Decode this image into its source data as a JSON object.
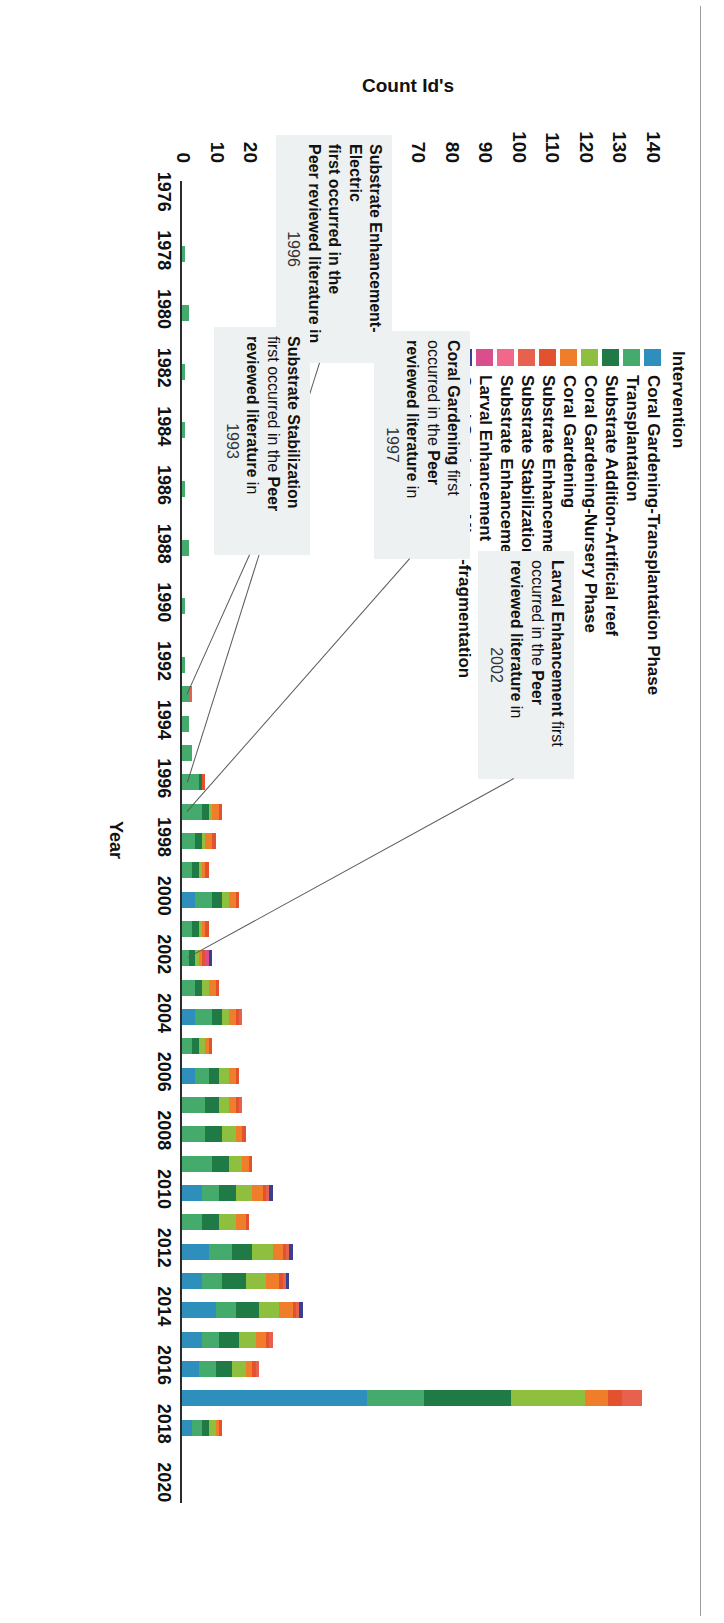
{
  "chart_data": {
    "type": "bar",
    "subtype": "stacked-horizontal-bar",
    "title": "",
    "xlabel": "Year",
    "ylabel": "Count Id's",
    "ylim": [
      0,
      140
    ],
    "yticks": [
      0,
      10,
      20,
      30,
      40,
      50,
      60,
      70,
      80,
      90,
      100,
      110,
      120,
      130,
      140
    ],
    "grid": false,
    "legend_position": "top-left",
    "legend_title": "Intervention",
    "categories": [
      "1976",
      "1977",
      "1978",
      "1979",
      "1980",
      "1981",
      "1982",
      "1983",
      "1984",
      "1985",
      "1986",
      "1987",
      "1988",
      "1989",
      "1990",
      "1991",
      "1992",
      "1993",
      "1994",
      "1995",
      "1996",
      "1997",
      "1998",
      "1999",
      "2000",
      "2001",
      "2002",
      "2003",
      "2004",
      "2005",
      "2006",
      "2007",
      "2008",
      "2009",
      "2010",
      "2011",
      "2012",
      "2013",
      "2014",
      "2015",
      "2016",
      "2017",
      "2018",
      "2019",
      "2020"
    ],
    "series": [
      {
        "name": "Coral Gardening-Transplantation Phase",
        "color": "#2e8fbd",
        "values": [
          0,
          0,
          0,
          0,
          0,
          0,
          0,
          0,
          0,
          0,
          0,
          0,
          0,
          0,
          0,
          0,
          0,
          0,
          0,
          0,
          0,
          0,
          0,
          0,
          4,
          0,
          0,
          0,
          4,
          0,
          4,
          0,
          0,
          0,
          6,
          0,
          8,
          6,
          10,
          6,
          5,
          55,
          3,
          0,
          0
        ]
      },
      {
        "name": "Transplantation",
        "color": "#45ab6d",
        "values": [
          0,
          0,
          1,
          0,
          2,
          0,
          1,
          0,
          1,
          0,
          1,
          0,
          2,
          0,
          1,
          0,
          1,
          2,
          2,
          3,
          5,
          6,
          4,
          3,
          5,
          3,
          2,
          4,
          5,
          3,
          4,
          7,
          7,
          9,
          5,
          6,
          7,
          6,
          6,
          5,
          5,
          17,
          3,
          0,
          0
        ]
      },
      {
        "name": "Substrate Addition-Artificial reef",
        "color": "#1f7a45",
        "values": [
          0,
          0,
          0,
          0,
          0,
          0,
          0,
          0,
          0,
          0,
          0,
          0,
          0,
          0,
          0,
          0,
          0,
          0,
          0,
          0,
          1,
          2,
          2,
          2,
          3,
          2,
          2,
          2,
          3,
          2,
          3,
          4,
          5,
          5,
          5,
          5,
          6,
          7,
          7,
          6,
          5,
          26,
          2,
          0,
          0
        ]
      },
      {
        "name": "Coral Gardening-Nursery Phase",
        "color": "#8fbf3f",
        "values": [
          0,
          0,
          0,
          0,
          0,
          0,
          0,
          0,
          0,
          0,
          0,
          0,
          0,
          0,
          0,
          0,
          0,
          0,
          0,
          0,
          0,
          1,
          1,
          1,
          2,
          1,
          1,
          2,
          2,
          2,
          3,
          3,
          4,
          4,
          5,
          5,
          6,
          6,
          6,
          5,
          4,
          22,
          2,
          0,
          0
        ]
      },
      {
        "name": "Coral Gardening",
        "color": "#ef7d29",
        "values": [
          0,
          0,
          0,
          0,
          0,
          0,
          0,
          0,
          0,
          0,
          0,
          0,
          0,
          0,
          0,
          0,
          0,
          0,
          0,
          0,
          0,
          2,
          2,
          1,
          2,
          1,
          1,
          2,
          2,
          1,
          2,
          2,
          2,
          2,
          3,
          3,
          3,
          4,
          4,
          3,
          2,
          7,
          1,
          0,
          0
        ]
      },
      {
        "name": "Substrate Enhancement-Electric",
        "color": "#e2522f",
        "values": [
          0,
          0,
          0,
          0,
          0,
          0,
          0,
          0,
          0,
          0,
          0,
          0,
          0,
          0,
          0,
          0,
          0,
          0,
          0,
          0,
          1,
          1,
          1,
          1,
          1,
          1,
          1,
          1,
          1,
          1,
          1,
          1,
          1,
          1,
          1,
          1,
          1,
          1,
          1,
          1,
          1,
          4,
          1,
          0,
          0
        ]
      },
      {
        "name": "Substrate Stabilization",
        "color": "#e8614f",
        "values": [
          0,
          0,
          0,
          0,
          0,
          0,
          0,
          0,
          0,
          0,
          0,
          0,
          0,
          0,
          0,
          0,
          0,
          1,
          0,
          0,
          0,
          0,
          0,
          0,
          0,
          0,
          0,
          0,
          1,
          0,
          0,
          1,
          0,
          0,
          1,
          0,
          1,
          1,
          1,
          1,
          1,
          6,
          0,
          0,
          0
        ]
      },
      {
        "name": "Substrate Enhancement-Algae removal",
        "color": "#f0698c",
        "values": [
          0,
          0,
          0,
          0,
          0,
          0,
          0,
          0,
          0,
          0,
          0,
          0,
          0,
          0,
          0,
          0,
          0,
          0,
          0,
          0,
          0,
          0,
          0,
          0,
          0,
          0,
          0,
          0,
          0,
          0,
          0,
          0,
          0,
          0,
          0,
          0,
          0,
          0,
          0,
          0,
          0,
          0,
          0,
          0,
          0
        ]
      },
      {
        "name": "Larval Enhancement",
        "color": "#d94f8e",
        "values": [
          0,
          0,
          0,
          0,
          0,
          0,
          0,
          0,
          0,
          0,
          0,
          0,
          0,
          0,
          0,
          0,
          0,
          0,
          0,
          0,
          0,
          0,
          0,
          0,
          0,
          0,
          1,
          0,
          0,
          0,
          0,
          0,
          0,
          0,
          0,
          0,
          0,
          0,
          0,
          0,
          0,
          0,
          0,
          0,
          0
        ]
      },
      {
        "name": "Coral Gardening-Micro-fragmentation",
        "color": "#3b3f8f",
        "values": [
          0,
          0,
          0,
          0,
          0,
          0,
          0,
          0,
          0,
          0,
          0,
          0,
          0,
          0,
          0,
          0,
          0,
          0,
          0,
          0,
          0,
          0,
          0,
          0,
          0,
          0,
          1,
          0,
          0,
          0,
          0,
          0,
          0,
          0,
          1,
          0,
          1,
          1,
          1,
          0,
          0,
          0,
          0,
          0,
          0
        ]
      }
    ],
    "xtick_labels": [
      "1976",
      "1978",
      "1980",
      "1982",
      "1984",
      "1986",
      "1988",
      "1990",
      "1992",
      "1994",
      "1996",
      "1998",
      "2000",
      "2002",
      "2004",
      "2006",
      "2008",
      "2010",
      "2012",
      "2014",
      "2016",
      "2018",
      "2020"
    ],
    "annotations": [
      {
        "id": "larval-enhancement",
        "bold1": "Larval Enhancement",
        "rest1": " first",
        "line2a": "occurred in the ",
        "line2b": "Peer",
        "line3a": "reviewed literature",
        "line3b": " in",
        "year": "2002",
        "target_category": "2002"
      },
      {
        "id": "coral-gardening",
        "bold1": "Coral Gardening",
        "rest1": " first",
        "line2a": "occurred in the ",
        "line2b": "Peer",
        "line3a": "reviewed literature",
        "line3b": " in",
        "year": "1997",
        "target_category": "1997"
      },
      {
        "id": "substrate-enhancement-electric",
        "bold1": "Substrate Enhancement-",
        "rest1": "",
        "line2a": "",
        "line2b": "Electric",
        "line3a": " first occurred in the",
        "line3b": "",
        "line4": "Peer reviewed literature in",
        "year": "1996",
        "target_category": "1996"
      },
      {
        "id": "substrate-stabilization",
        "bold1": "Substrate Stabilization",
        "rest1": "",
        "line2a": "first occurred in the ",
        "line2b": "Peer",
        "line3a": "reviewed literature",
        "line3b": " in",
        "year": "1993",
        "target_category": "1993"
      }
    ]
  },
  "legend": {
    "title": "Intervention",
    "items": [
      {
        "label": "Coral Gardening-Transplantation Phase",
        "color": "#2e8fbd"
      },
      {
        "label": "Transplantation",
        "color": "#45ab6d"
      },
      {
        "label": "Substrate Addition-Artificial reef",
        "color": "#1f7a45"
      },
      {
        "label": "Coral Gardening-Nursery Phase",
        "color": "#8fbf3f"
      },
      {
        "label": "Coral Gardening",
        "color": "#ef7d29"
      },
      {
        "label": "Substrate Enhancement-Electric",
        "color": "#e2522f"
      },
      {
        "label": "Substrate Stabilization",
        "color": "#e8614f"
      },
      {
        "label": "Substrate Enhancement-Algae removal",
        "color": "#f0698c"
      },
      {
        "label": "Larval Enhancement",
        "color": "#d94f8e"
      },
      {
        "label": "Coral Gardening-Micro-fragmentation",
        "color": "#3b3f8f"
      }
    ]
  },
  "axes": {
    "value_axis_label": "Count Id's",
    "category_axis_label": "Year"
  }
}
